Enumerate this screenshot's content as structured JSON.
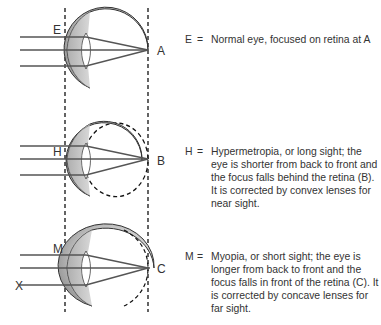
{
  "diagram": {
    "labels": {
      "E": "E",
      "A": "A",
      "H": "H",
      "B": "B",
      "M": "M",
      "C": "C",
      "X": "X"
    },
    "colors": {
      "eyeball": "#b8b8b8",
      "ray": "#555555",
      "dashed": "#111111",
      "text": "#333333"
    }
  },
  "descriptions": [
    {
      "key": "E",
      "eq": "=",
      "text": "Normal eye, focused on retina at A"
    },
    {
      "key": "H",
      "eq": "=",
      "text": "Hypermetropia, or long sight; the eye is shorter from back to front and the focus falls behind the retina (B). It is corrected by convex lenses for near sight."
    },
    {
      "key": "M",
      "eq": "=",
      "text": "Myopia, or short sight; the eye is longer from back to front and the focus falls in front of the retina (C). It is corrected by concave lenses for far sight."
    }
  ]
}
